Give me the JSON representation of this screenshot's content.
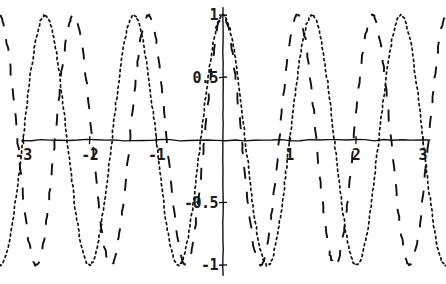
{
  "chart_data": {
    "type": "line",
    "title": "",
    "xlabel": "",
    "ylabel": "",
    "style": "hand-drawn-sketch",
    "grid": false,
    "legend": "none",
    "xlim": [
      -3.35,
      3.35
    ],
    "ylim": [
      -1.15,
      1.12
    ],
    "x_ticks": [
      {
        "value": -3,
        "label": "-3"
      },
      {
        "value": -2,
        "label": "-2"
      },
      {
        "value": -1,
        "label": "-1"
      },
      {
        "value": 1,
        "label": "1"
      },
      {
        "value": 2,
        "label": "2"
      },
      {
        "value": 3,
        "label": "3"
      }
    ],
    "y_ticks": [
      {
        "value": 1,
        "label": "1"
      },
      {
        "value": 0.5,
        "label": "0.5"
      },
      {
        "value": -0.5,
        "label": "-0.5"
      },
      {
        "value": -1,
        "label": "-1"
      }
    ],
    "series": [
      {
        "name": "dotted-curve",
        "linestyle": "dotted",
        "color": "#111111",
        "expression": "cos(4.7x)",
        "amplitude": 1,
        "period": 1.337,
        "phase": 0,
        "peaks_x": [
          -3.0,
          -1.663,
          -0.326,
          1.011,
          2.348
        ],
        "troughs_x": [
          -2.331,
          -0.994,
          0.343,
          1.68,
          3.017
        ]
      },
      {
        "name": "dashed-curve",
        "linestyle": "dashed",
        "color": "#111111",
        "expression": "cos(5.6x)",
        "amplitude": 1,
        "period": 1.122,
        "phase": 0,
        "peaks_x": [
          -2.66,
          -1.54,
          -0.42,
          0.7,
          1.82,
          2.94
        ],
        "troughs_x": [
          -3.22,
          -2.1,
          -0.98,
          0.14,
          1.26,
          2.38
        ]
      }
    ],
    "axes": {
      "x_axis_y_value": 0,
      "y_axis_x_value": 0,
      "axis_color": "#111111"
    }
  }
}
